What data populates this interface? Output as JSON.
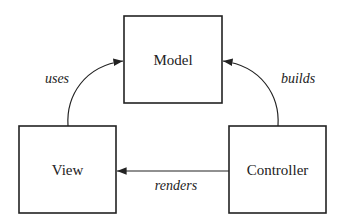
{
  "diagram": {
    "type": "MVC",
    "nodes": [
      {
        "id": "model",
        "label": "Model"
      },
      {
        "id": "view",
        "label": "View"
      },
      {
        "id": "controller",
        "label": "Controller"
      }
    ],
    "edges": [
      {
        "from": "view",
        "to": "model",
        "label": "uses"
      },
      {
        "from": "controller",
        "to": "model",
        "label": "builds"
      },
      {
        "from": "controller",
        "to": "view",
        "label": "renders"
      }
    ],
    "colors": {
      "stroke": "#222222",
      "background": "#ffffff"
    }
  }
}
